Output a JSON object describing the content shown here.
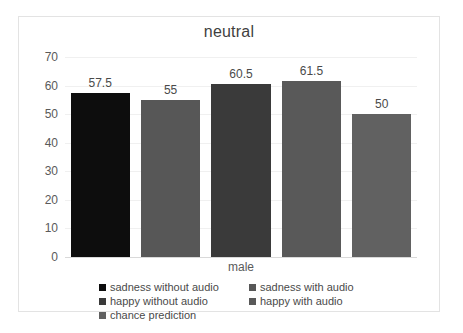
{
  "chart_data": {
    "type": "bar",
    "title": "neutral",
    "xlabel": "male",
    "ylabel": "",
    "categories": [
      "male"
    ],
    "grid": true,
    "legend_position": "bottom",
    "ylim": [
      0,
      70
    ],
    "yticks": [
      70,
      60,
      50,
      40,
      30,
      20,
      10,
      0
    ],
    "series": [
      {
        "name": "sadness without audio",
        "values": [
          57.5
        ],
        "label": "57.5",
        "color": "#0d0d0d"
      },
      {
        "name": "sadness with audio",
        "values": [
          55
        ],
        "label": "55",
        "color": "#575757"
      },
      {
        "name": "happy without audio",
        "values": [
          60.5
        ],
        "label": "60.5",
        "color": "#3a3a3a"
      },
      {
        "name": "happy with audio",
        "values": [
          61.5
        ],
        "label": "61.5",
        "color": "#595959"
      },
      {
        "name": "chance prediction",
        "values": [
          50
        ],
        "label": "50",
        "color": "#616161"
      }
    ]
  },
  "legend": {
    "items": [
      {
        "label": "sadness without audio",
        "color": "#0d0d0d"
      },
      {
        "label": "sadness with audio",
        "color": "#575757"
      },
      {
        "label": "happy without audio",
        "color": "#3a3a3a"
      },
      {
        "label": "happy with audio",
        "color": "#595959"
      },
      {
        "label": "chance prediction",
        "color": "#616161"
      }
    ]
  }
}
